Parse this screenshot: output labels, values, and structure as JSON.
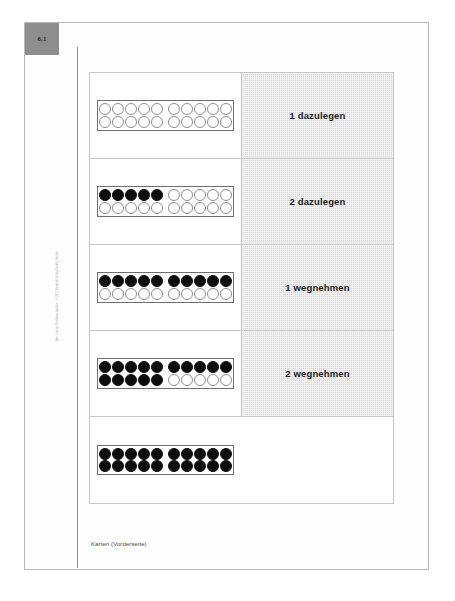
{
  "page": {
    "badge_number": "6.1",
    "copyright": "Aus: Lorenz, Rechenschwäche · © 2012 Friedrich Verlag GmbH, Seelze",
    "caption": "Karten (Vorderseite)"
  },
  "colors": {
    "sheet_background": "#fefefe",
    "badge_background": "#8e8e8e",
    "label_cell_background": "#d7d7d7",
    "dot_filled": "#0d0d0d",
    "dot_empty": "#ffffff",
    "border": "#c6c6c6"
  },
  "card_table": {
    "rows": [
      {
        "id": "row-1",
        "label": "1 dazulegen",
        "has_label": true,
        "filled_count": 0,
        "total_count": 20,
        "frame": {
          "top": [
            false,
            false,
            false,
            false,
            false,
            false,
            false,
            false,
            false,
            false
          ],
          "bottom": [
            false,
            false,
            false,
            false,
            false,
            false,
            false,
            false,
            false,
            false
          ]
        }
      },
      {
        "id": "row-2",
        "label": "2 dazulegen",
        "has_label": true,
        "filled_count": 5,
        "total_count": 20,
        "frame": {
          "top": [
            true,
            true,
            true,
            true,
            true,
            false,
            false,
            false,
            false,
            false
          ],
          "bottom": [
            false,
            false,
            false,
            false,
            false,
            false,
            false,
            false,
            false,
            false
          ]
        }
      },
      {
        "id": "row-3",
        "label": "1 wegnehmen",
        "has_label": true,
        "filled_count": 10,
        "total_count": 20,
        "frame": {
          "top": [
            true,
            true,
            true,
            true,
            true,
            true,
            true,
            true,
            true,
            true
          ],
          "bottom": [
            false,
            false,
            false,
            false,
            false,
            false,
            false,
            false,
            false,
            false
          ]
        }
      },
      {
        "id": "row-4",
        "label": "2 wegnehmen",
        "has_label": true,
        "filled_count": 15,
        "total_count": 20,
        "frame": {
          "top": [
            true,
            true,
            true,
            true,
            true,
            true,
            true,
            true,
            true,
            true
          ],
          "bottom": [
            true,
            true,
            true,
            true,
            true,
            false,
            false,
            false,
            false,
            false
          ]
        }
      },
      {
        "id": "row-5",
        "label": "",
        "has_label": false,
        "filled_count": 20,
        "total_count": 20,
        "frame": {
          "top": [
            true,
            true,
            true,
            true,
            true,
            true,
            true,
            true,
            true,
            true
          ],
          "bottom": [
            true,
            true,
            true,
            true,
            true,
            true,
            true,
            true,
            true,
            true
          ]
        }
      }
    ]
  }
}
